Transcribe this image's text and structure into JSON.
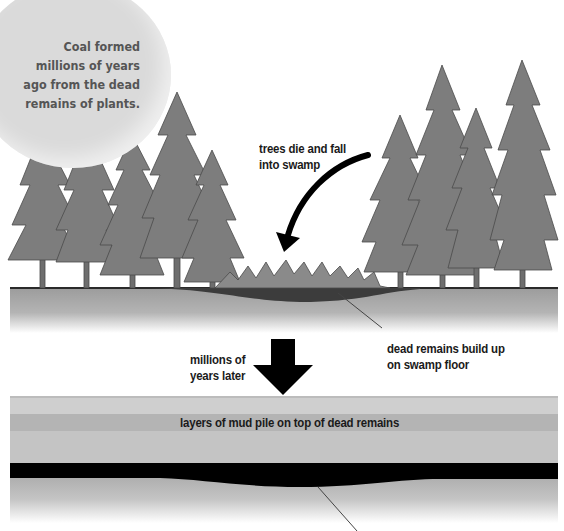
{
  "title_bubble": {
    "lines": [
      "Coal formed",
      "millions of years",
      "ago from the dead",
      "remains of plants."
    ]
  },
  "stage1": {
    "arrow_label_lines": [
      "trees die and fall",
      "into swamp"
    ],
    "floor_label_lines": [
      "dead remains build up",
      "on swamp floor"
    ]
  },
  "transition": {
    "label_lines": [
      "millions of",
      "years later"
    ]
  },
  "stage2": {
    "mud_label": "layers of mud pile on top of dead remains"
  },
  "colors": {
    "tree": "#7a7a7a",
    "ground": "#a8a8a8",
    "peat": "#3a3a3a",
    "coal_seam": "#000000",
    "bubble": "#d9d9d9"
  }
}
